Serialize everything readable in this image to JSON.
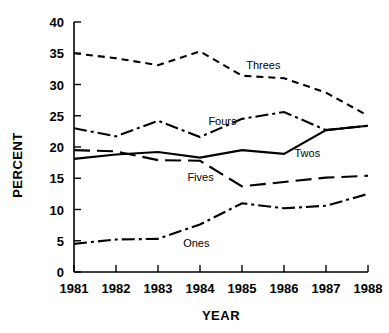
{
  "chart_data": {
    "type": "line",
    "title": "",
    "xlabel": "YEAR",
    "ylabel": "PERCENT",
    "x": [
      1981,
      1982,
      1983,
      1984,
      1985,
      1986,
      1987,
      1988
    ],
    "categories": [
      "1981",
      "1982",
      "1983",
      "1984",
      "1985",
      "1986",
      "1987",
      "1988"
    ],
    "xlim": [
      1981,
      1988
    ],
    "ylim": [
      0,
      40
    ],
    "yticks": [
      0,
      5,
      10,
      15,
      20,
      25,
      30,
      35,
      40
    ],
    "ytick_labels": [
      "0",
      "5",
      "10",
      "15",
      "20",
      "25",
      "30",
      "35",
      "40"
    ],
    "xtick_labels": [
      "1981",
      "1982",
      "1983",
      "1984",
      "1985",
      "1986",
      "1987",
      "1988"
    ],
    "grid": false,
    "legend_position": "inline-annotations",
    "series": [
      {
        "name": "Threes",
        "label": "Threes",
        "style": "dashed",
        "dash_pattern": "7,5",
        "color": "#000000",
        "values": [
          35.0,
          34.2,
          33.1,
          35.3,
          31.4,
          31.0,
          28.7,
          25.0
        ],
        "label_x": 1985.1,
        "label_y": 33.1
      },
      {
        "name": "Fours",
        "label": "Fours",
        "style": "dash-dot",
        "dash_pattern": "13,4,3,4",
        "color": "#000000",
        "values": [
          23.0,
          21.7,
          24.2,
          21.6,
          24.5,
          25.6,
          22.7,
          23.4
        ],
        "label_x": 1984.2,
        "label_y": 24.2
      },
      {
        "name": "Twos",
        "label": "Twos",
        "style": "solid",
        "dash_pattern": "none",
        "color": "#000000",
        "values": [
          18.1,
          18.8,
          19.2,
          18.3,
          19.5,
          18.9,
          22.7,
          23.4
        ],
        "label_x": 1986.25,
        "label_y": 19.0
      },
      {
        "name": "Fives",
        "label": "Fives",
        "style": "long-dash",
        "dash_pattern": "16,7",
        "color": "#000000",
        "values": [
          19.5,
          19.3,
          17.9,
          17.8,
          13.7,
          14.4,
          15.1,
          15.4
        ],
        "label_x": 1983.7,
        "label_y": 15.2
      },
      {
        "name": "Ones",
        "label": "Ones",
        "style": "dash-dot",
        "dash_pattern": "13,4,3,4",
        "color": "#000000",
        "values": [
          4.5,
          5.2,
          5.3,
          7.6,
          11.0,
          10.2,
          10.6,
          12.5
        ],
        "label_x": 1983.6,
        "label_y": 4.6
      }
    ]
  },
  "axis": {
    "y_title": "PERCENT",
    "x_title": "YEAR"
  }
}
